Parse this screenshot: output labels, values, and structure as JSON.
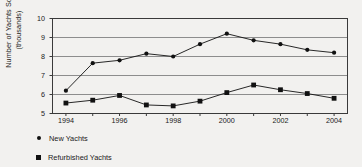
{
  "chart_data": {
    "type": "line",
    "title": "",
    "xlabel": "",
    "ylabel": "Number of Yachts Sold\n(thousands)",
    "x": [
      1994,
      1995,
      1996,
      1997,
      1998,
      1999,
      2000,
      2001,
      2002,
      2003,
      2004
    ],
    "xtick_labels": [
      "1994",
      "1996",
      "1998",
      "2000",
      "2002",
      "2004"
    ],
    "xticks": [
      1994,
      1996,
      1998,
      2000,
      2002,
      2004
    ],
    "xlim": [
      1993.5,
      2004.5
    ],
    "ytick_labels": [
      "5",
      "6",
      "7",
      "8",
      "9",
      "10"
    ],
    "yticks": [
      5,
      6,
      7,
      8,
      9,
      10
    ],
    "ylim": [
      5,
      10
    ],
    "grid": "horizontal",
    "legend_position": "below-left",
    "series": [
      {
        "name": "New Yachts",
        "marker": "circle",
        "color": "#111111",
        "values": [
          6.2,
          7.65,
          7.8,
          8.15,
          8.0,
          8.65,
          9.2,
          8.85,
          8.65,
          8.35,
          8.2
        ]
      },
      {
        "name": "Refurbished Yachts",
        "marker": "square",
        "color": "#111111",
        "values": [
          5.55,
          5.7,
          5.95,
          5.45,
          5.4,
          5.65,
          6.1,
          6.5,
          6.25,
          6.05,
          5.8
        ]
      }
    ]
  },
  "legend": {
    "items": [
      {
        "label": "New Yachts",
        "marker": "circle"
      },
      {
        "label": "Refurbished Yachts",
        "marker": "square"
      }
    ]
  }
}
